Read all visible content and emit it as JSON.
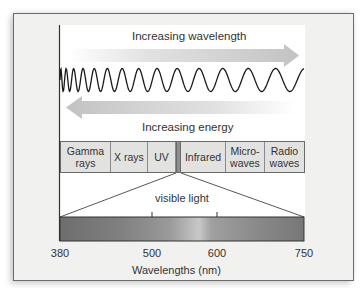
{
  "diagram": {
    "title_top_arrow": "Increasing wavelength",
    "title_bottom_arrow": "Increasing energy",
    "bands": [
      {
        "label": "Gamma rays",
        "line1": "Gamma",
        "line2": "rays",
        "width": 51
      },
      {
        "label": "X rays",
        "line1": "X rays",
        "line2": "",
        "width": 37
      },
      {
        "label": "UV",
        "line1": "UV",
        "line2": "",
        "width": 28
      },
      {
        "label": "",
        "line1": "",
        "line2": "",
        "width": 5,
        "visible": true
      },
      {
        "label": "Infrared",
        "line1": "Infrared",
        "line2": "",
        "width": 45
      },
      {
        "label": "Microwaves",
        "line1": "Micro-",
        "line2": "waves",
        "width": 39
      },
      {
        "label": "Radio waves",
        "line1": "Radio",
        "line2": "waves",
        "width": 40
      }
    ],
    "visible_light_label": "visible light",
    "axis": {
      "label": "Wavelengths (nm)",
      "ticks": [
        {
          "value": "380",
          "x": 60
        },
        {
          "value": "500",
          "x": 152
        },
        {
          "value": "600",
          "x": 217
        },
        {
          "value": "750",
          "x": 304
        }
      ]
    },
    "colors": {
      "frame_bg": "#f1f1f0",
      "panel_bg": "#ffffff",
      "arrow": "#c9c9c9",
      "band_bg": "#e2e2e1",
      "visible_band": "#8e8e8e",
      "wave": "#1a1a1a"
    }
  }
}
